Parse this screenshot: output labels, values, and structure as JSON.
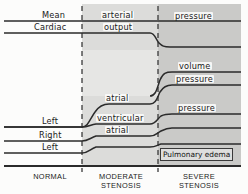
{
  "figure": {
    "type": "schematic-trend-diagram"
  },
  "zones": [
    {
      "key": "normal",
      "label_line1": "NORMAL",
      "label_line2": "",
      "x_start": 0,
      "x_end": 82,
      "shade": "#fcfcfb"
    },
    {
      "key": "moderate",
      "label_line1": "MODERATE",
      "label_line2": "STENOSIS",
      "x_start": 82,
      "x_end": 158,
      "shade": "#dcdcda"
    },
    {
      "key": "severe",
      "label_line1": "SEVERE",
      "label_line2": "STENOSIS",
      "x_start": 158,
      "x_end": 241,
      "shade": "#cacac8"
    }
  ],
  "boundaries": [
    {
      "name": "normal-moderate-divider",
      "x": 82
    },
    {
      "name": "moderate-severe-divider",
      "x": 158
    }
  ],
  "traces": [
    {
      "name": "mean-arterial-pressure",
      "label_parts": [
        "Mean",
        "arterial",
        "pressure"
      ],
      "description": "flat across all zones",
      "points": [
        [
          4,
          21
        ],
        [
          82,
          21
        ],
        [
          158,
          21
        ],
        [
          241,
          21
        ]
      ]
    },
    {
      "name": "cardiac-output",
      "label_parts": [
        "Cardiac",
        "output",
        ""
      ],
      "description": "normal through moderate, falls in severe stenosis",
      "points": [
        [
          4,
          33
        ],
        [
          82,
          33
        ],
        [
          150,
          33
        ],
        [
          158,
          40
        ],
        [
          166,
          47
        ],
        [
          241,
          47
        ]
      ]
    },
    {
      "name": "left-atrial-volume",
      "label_parts": [
        "",
        "",
        "volume"
      ],
      "description": "rises steeply at severe stenosis onset",
      "points": [
        [
          150,
          96
        ],
        [
          158,
          84
        ],
        [
          168,
          72
        ],
        [
          241,
          72
        ]
      ]
    },
    {
      "name": "left-atrial-pressure-upper",
      "label_parts": [
        "",
        "",
        "pressure"
      ],
      "description": "rises steeply at severe stenosis onset",
      "points": [
        [
          150,
          104
        ],
        [
          158,
          95
        ],
        [
          168,
          85
        ],
        [
          241,
          85
        ]
      ]
    },
    {
      "name": "left-atrial-pressure",
      "label_parts": [
        "Left",
        "atrial",
        ""
      ],
      "description": "rises through moderate stenosis then plateaus",
      "points": [
        [
          4,
          127
        ],
        [
          82,
          127
        ],
        [
          92,
          112
        ],
        [
          104,
          104
        ],
        [
          150,
          104
        ],
        [
          158,
          104
        ]
      ]
    },
    {
      "name": "left-ventricular-pressure",
      "label_parts": [
        "Left",
        "ventricular",
        "pressure"
      ],
      "description": "gentle rise in moderate, step up at severe",
      "points": [
        [
          4,
          127
        ],
        [
          82,
          127
        ],
        [
          95,
          124
        ],
        [
          150,
          124
        ],
        [
          158,
          118
        ],
        [
          170,
          114
        ],
        [
          241,
          114
        ]
      ]
    },
    {
      "name": "right-atrial-pressure",
      "label_parts": [
        "Right",
        "atrial",
        ""
      ],
      "description": "slight rise in moderate stenosis",
      "points": [
        [
          4,
          141
        ],
        [
          82,
          141
        ],
        [
          92,
          136
        ],
        [
          150,
          136
        ],
        [
          158,
          132
        ],
        [
          170,
          128
        ],
        [
          241,
          128
        ]
      ]
    },
    {
      "name": "left-lower-trace",
      "label_parts": [
        "Left",
        "",
        ""
      ],
      "description": "rises at moderate onset, continues into severe",
      "points": [
        [
          4,
          153
        ],
        [
          82,
          153
        ],
        [
          92,
          146
        ],
        [
          150,
          146
        ],
        [
          158,
          143
        ],
        [
          241,
          143
        ]
      ]
    }
  ],
  "labels": {
    "mean": "Mean",
    "cardiac": "Cardiac",
    "arterial": "arterial",
    "output": "output",
    "pressure_top": "pressure",
    "volume": "volume",
    "pressure_volume": "pressure",
    "left_atrial": "Left",
    "atrial_upper": "atrial",
    "left_ventricular": "Left",
    "ventricular": "ventricular",
    "pressure_ventricular": "pressure",
    "right": "Right",
    "atrial_lower": "atrial",
    "left_lowest": "Left",
    "pulmonary_edema": "Pulmonary edema"
  },
  "axis": {
    "baseline_y": 166,
    "normal": "NORMAL",
    "moderate_line1": "MODERATE",
    "moderate_line2": "STENOSIS",
    "severe_line1": "SEVERE",
    "severe_line2": "STENOSIS"
  },
  "colors": {
    "line": "#2b2b2b",
    "background": "#fcfcfb",
    "moderate_shade": "#dcdcda",
    "severe_shade": "#cacac8",
    "text": "#1a1a1a",
    "box_fill": "#dedede"
  }
}
